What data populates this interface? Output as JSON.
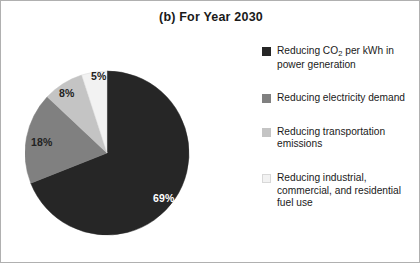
{
  "figure": {
    "title": "(b) For Year 2030",
    "frame_color": "#b0b0b0",
    "background": "#ffffff"
  },
  "chart_data": {
    "type": "pie",
    "title": "(b) For Year 2030",
    "xlabel": "",
    "ylabel": "",
    "legend_position": "right",
    "grid": false,
    "categories": [
      "Reducing CO2 per kWh in power generation",
      "Reducing electricity demand",
      "Reducing transportation emissions",
      "Reducing industrial, commercial, and residential fuel use"
    ],
    "values": [
      69,
      18,
      8,
      5
    ],
    "value_labels": [
      "69%",
      "18%",
      "8%",
      "5%"
    ],
    "colors": [
      "#262626",
      "#808080",
      "#c4c4c4",
      "#f2f2f2"
    ],
    "start_angle_deg": 0,
    "direction": "clockwise",
    "units": "percent"
  },
  "pie": {
    "slices": [
      {
        "name": "power-generation",
        "label": "69%",
        "value": 69,
        "color": "#262626",
        "label_tone": "on-dark"
      },
      {
        "name": "electricity-demand",
        "label": "18%",
        "value": 18,
        "color": "#808080",
        "label_tone": "on-light"
      },
      {
        "name": "transportation-emissions",
        "label": "8%",
        "value": 8,
        "color": "#c4c4c4",
        "label_tone": "on-light"
      },
      {
        "name": "industrial-commercial-residential",
        "label": "5%",
        "value": 5,
        "color": "#f2f2f2",
        "label_tone": "on-light"
      }
    ]
  },
  "legend": {
    "items": [
      {
        "swatch_color": "#262626",
        "line1_pre": "Reducing CO",
        "line1_sub": "2",
        "line1_post": " per kWh in",
        "line2": "power generation"
      },
      {
        "swatch_color": "#808080",
        "line1": "Reducing electricity",
        "line2": "demand"
      },
      {
        "swatch_color": "#c4c4c4",
        "line1": "Reducing transportation",
        "line2": "emissions"
      },
      {
        "swatch_color": "#f2f2f2",
        "line1": "Reducing industrial,",
        "line2": "commercial, and",
        "line3": "residential fuel use"
      }
    ]
  }
}
